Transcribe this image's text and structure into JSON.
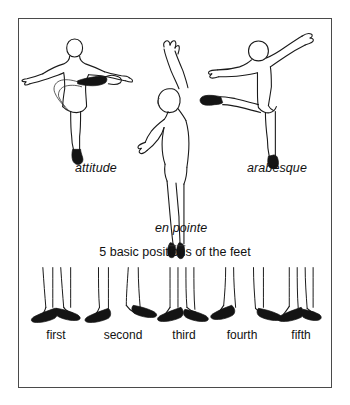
{
  "figure": {
    "frame_color": "#4a4a4a",
    "ink_color": "#1a1a1a",
    "background_color": "#ffffff"
  },
  "poses": [
    {
      "id": "attitude",
      "label": "attitude"
    },
    {
      "id": "en-pointe",
      "label": "en pointe"
    },
    {
      "id": "arabesque",
      "label": "arabesque"
    }
  ],
  "feet_section": {
    "heading": "5 basic positions of the feet",
    "positions": [
      {
        "ordinal": "first"
      },
      {
        "ordinal": "second"
      },
      {
        "ordinal": "third"
      },
      {
        "ordinal": "fourth"
      },
      {
        "ordinal": "fifth"
      }
    ]
  }
}
